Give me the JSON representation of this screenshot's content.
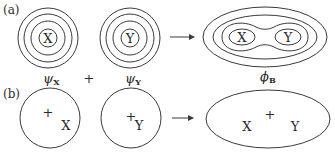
{
  "panels": {
    "a": {
      "label": "(a)",
      "atom_x": "X",
      "atom_y": "Y",
      "psi_x": {
        "symbol": "ψ",
        "subscript": "X"
      },
      "psi_y": {
        "symbol": "ψ",
        "subscript": "Y"
      },
      "plus": "+",
      "phi_b": {
        "symbol": "ϕ",
        "subscript": "B"
      },
      "result_atom_x": "X",
      "result_atom_y": "Y"
    },
    "b": {
      "label": "(b)",
      "atom_x": "X",
      "atom_y": "Y",
      "nucleus_mark": "+",
      "result_atom_x": "X",
      "result_atom_y": "Y",
      "result_center_mark": "+"
    }
  }
}
